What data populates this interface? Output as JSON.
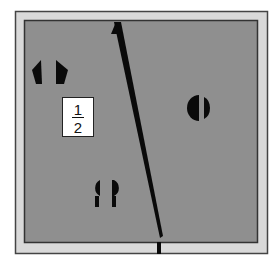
{
  "figure": {
    "colors": {
      "background": "#ffffff",
      "outer_frame": "#d9d9d9",
      "frame_border": "#444444",
      "field": "#8f8f8f",
      "shapes": "#0a0a0a",
      "label_bg": "#ffffff"
    },
    "label": {
      "numerator": "1",
      "denominator": "2"
    },
    "shapes": [
      {
        "name": "pentagon-pair",
        "kind": "split pentagon",
        "position": "upper-left"
      },
      {
        "name": "circle-pair",
        "kind": "split circle",
        "position": "right"
      },
      {
        "name": "keyhole-pair",
        "kind": "split keyhole / teardrop",
        "position": "lower-center"
      }
    ],
    "line": {
      "kind": "diagonal dividing line",
      "from": "top-center",
      "to": "bottom-center-right"
    }
  }
}
